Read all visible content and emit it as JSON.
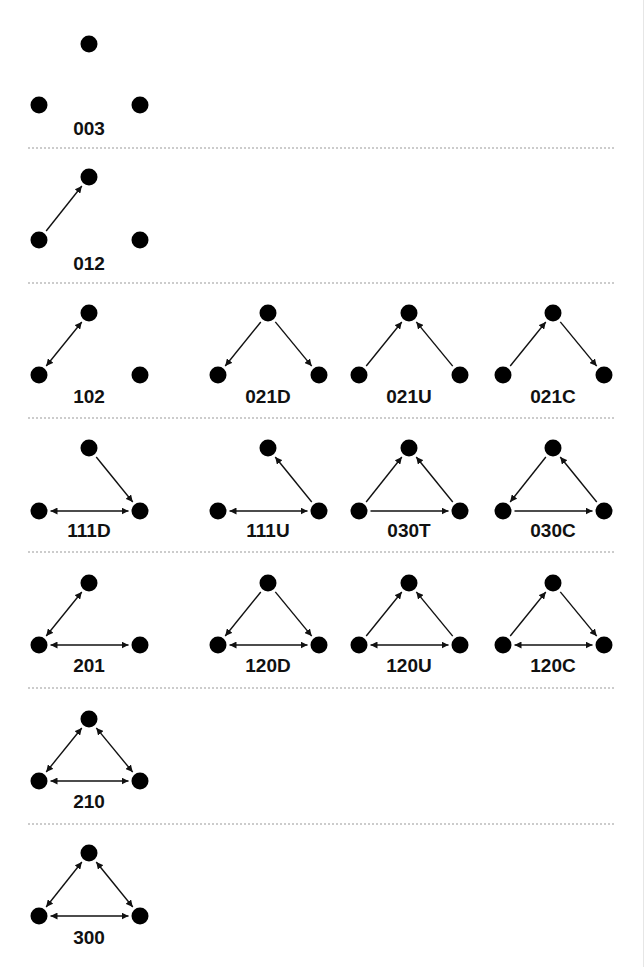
{
  "colors": {
    "node": "#000000",
    "edge": "#111111",
    "divider": "#9a9a9a",
    "background": "#ffffff"
  },
  "rows": [
    {
      "y_top": 44,
      "y_bottom": 105,
      "y_label": 135,
      "divider_y": 148,
      "triads": [
        {
          "col": 0,
          "label": "003",
          "edges": []
        }
      ]
    },
    {
      "y_top": 177,
      "y_bottom": 240,
      "y_label": 270,
      "divider_y": 283,
      "triads": [
        {
          "col": 0,
          "label": "012",
          "edges": [
            [
              "L",
              "T"
            ]
          ]
        }
      ]
    },
    {
      "y_top": 313,
      "y_bottom": 375,
      "y_label": 403,
      "divider_y": 418,
      "triads": [
        {
          "col": 0,
          "label": "102",
          "edges": [
            [
              "L",
              "T"
            ],
            [
              "T",
              "L"
            ]
          ]
        },
        {
          "col": 1,
          "label": "021D",
          "edges": [
            [
              "T",
              "L"
            ],
            [
              "T",
              "R"
            ]
          ]
        },
        {
          "col": 2,
          "label": "021U",
          "edges": [
            [
              "L",
              "T"
            ],
            [
              "R",
              "T"
            ]
          ]
        },
        {
          "col": 3,
          "label": "021C",
          "edges": [
            [
              "L",
              "T"
            ],
            [
              "T",
              "R"
            ]
          ]
        }
      ]
    },
    {
      "y_top": 448,
      "y_bottom": 511,
      "y_label": 537,
      "divider_y": 552,
      "triads": [
        {
          "col": 0,
          "label": "111D",
          "edges": [
            [
              "L",
              "R"
            ],
            [
              "R",
              "L"
            ],
            [
              "T",
              "R"
            ]
          ]
        },
        {
          "col": 1,
          "label": "111U",
          "edges": [
            [
              "L",
              "R"
            ],
            [
              "R",
              "L"
            ],
            [
              "R",
              "T"
            ]
          ]
        },
        {
          "col": 2,
          "label": "030T",
          "edges": [
            [
              "L",
              "T"
            ],
            [
              "R",
              "T"
            ],
            [
              "L",
              "R"
            ]
          ]
        },
        {
          "col": 3,
          "label": "030C",
          "edges": [
            [
              "T",
              "L"
            ],
            [
              "R",
              "T"
            ],
            [
              "L",
              "R"
            ]
          ]
        }
      ]
    },
    {
      "y_top": 583,
      "y_bottom": 645,
      "y_label": 672,
      "divider_y": 688,
      "triads": [
        {
          "col": 0,
          "label": "201",
          "edges": [
            [
              "L",
              "T"
            ],
            [
              "T",
              "L"
            ],
            [
              "L",
              "R"
            ],
            [
              "R",
              "L"
            ]
          ]
        },
        {
          "col": 1,
          "label": "120D",
          "edges": [
            [
              "T",
              "L"
            ],
            [
              "T",
              "R"
            ],
            [
              "L",
              "R"
            ],
            [
              "R",
              "L"
            ]
          ]
        },
        {
          "col": 2,
          "label": "120U",
          "edges": [
            [
              "L",
              "T"
            ],
            [
              "R",
              "T"
            ],
            [
              "L",
              "R"
            ],
            [
              "R",
              "L"
            ]
          ]
        },
        {
          "col": 3,
          "label": "120C",
          "edges": [
            [
              "L",
              "T"
            ],
            [
              "T",
              "R"
            ],
            [
              "L",
              "R"
            ],
            [
              "R",
              "L"
            ]
          ]
        }
      ]
    },
    {
      "y_top": 719,
      "y_bottom": 781,
      "y_label": 808,
      "divider_y": 824,
      "triads": [
        {
          "col": 0,
          "label": "210",
          "edges": [
            [
              "L",
              "T"
            ],
            [
              "T",
              "L"
            ],
            [
              "T",
              "R"
            ],
            [
              "R",
              "T"
            ],
            [
              "L",
              "R"
            ],
            [
              "R",
              "L"
            ]
          ]
        }
      ]
    },
    {
      "y_top": 853,
      "y_bottom": 916,
      "y_label": 944,
      "divider_y": null,
      "triads": [
        {
          "col": 0,
          "label": "300",
          "edges": [
            [
              "L",
              "T"
            ],
            [
              "T",
              "L"
            ],
            [
              "T",
              "R"
            ],
            [
              "R",
              "T"
            ],
            [
              "L",
              "R"
            ],
            [
              "R",
              "L"
            ]
          ]
        }
      ]
    }
  ],
  "layout": {
    "col_centers": [
      89,
      268,
      409,
      553
    ],
    "half_width": 51,
    "node_radius": 8.5,
    "divider_x1": 28,
    "divider_x2": 614
  }
}
